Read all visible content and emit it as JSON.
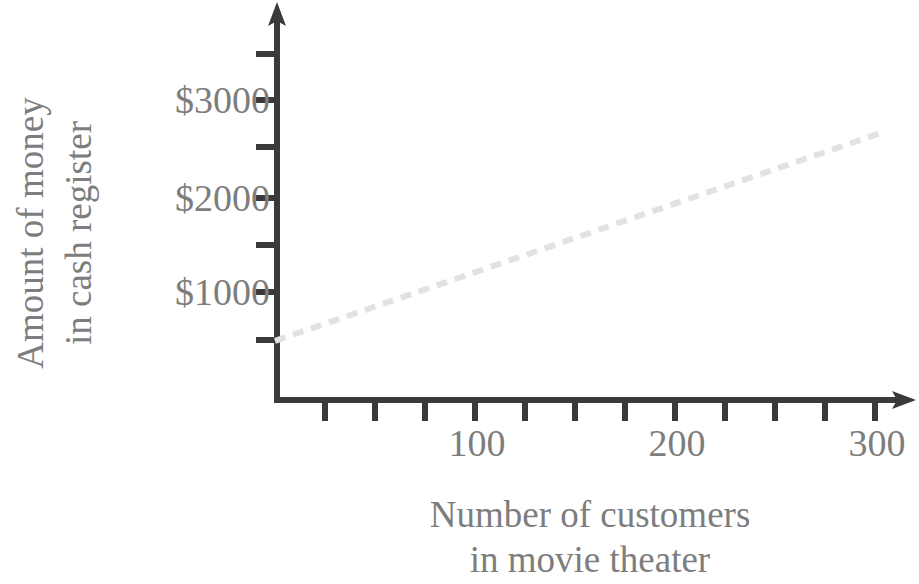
{
  "chart_data": {
    "type": "line",
    "title": "",
    "subtitle": "",
    "xlabel": "Number of customers in movie theater",
    "ylabel": "Amount of money in cash register",
    "xlabel_lines": [
      "Number of customers",
      "in movie theater"
    ],
    "ylabel_lines": [
      "Amount of money",
      "in cash register"
    ],
    "xlim": [
      0,
      310
    ],
    "ylim": [
      0,
      3500
    ],
    "x_tick_labels": [
      "100",
      "200",
      "300"
    ],
    "x_tick_values": [
      100,
      200,
      300
    ],
    "x_minor_tick_values": [
      50,
      100,
      150,
      200,
      250,
      300
    ],
    "x_all_tick_values": [
      50,
      100,
      150,
      200,
      250,
      300
    ],
    "y_tick_labels": [
      "$1000",
      "$2000",
      "$3000"
    ],
    "y_tick_values": [
      1000,
      2000,
      3000
    ],
    "y_all_tick_values": [
      500,
      1000,
      1500,
      2000,
      2500,
      3000,
      3500
    ],
    "grid": false,
    "legend": false,
    "legend_position": "none",
    "line_style": "dashed",
    "line_color": "#e2e2e2",
    "axis_color": "#3a3a3a",
    "text_color": "#7d7d7d",
    "background_color": "#ffffff",
    "series": [
      {
        "name": "Amount of money in cash register",
        "style": "dashed",
        "color": "#e2e2e2",
        "x": [
          0,
          50,
          100,
          150,
          200,
          250,
          304
        ],
        "values": [
          480,
          845,
          1210,
          1575,
          1940,
          2305,
          2700
        ],
        "intercept": 480,
        "slope_per_customer": 7.3
      }
    ],
    "annotations": []
  },
  "axes": {
    "y": {
      "ticks": [
        {
          "label": "$3000",
          "value": 3000
        },
        {
          "label": "$2000",
          "value": 2000
        },
        {
          "label": "$1000",
          "value": 1000
        }
      ],
      "title_lines": [
        "Amount of money",
        "in cash register"
      ]
    },
    "x": {
      "ticks": [
        {
          "label": "100",
          "value": 100
        },
        {
          "label": "200",
          "value": 200
        },
        {
          "label": "300",
          "value": 300
        }
      ],
      "title_lines": [
        "Number of customers",
        "in movie theater"
      ]
    }
  },
  "labels": {
    "y_3000": "$3000",
    "y_2000": "$2000",
    "y_1000": "$1000",
    "x_100": "100",
    "x_200": "200",
    "x_300": "300",
    "x_title_line1": "Number of customers",
    "x_title_line2": "in movie theater",
    "y_title_line1": "Amount of money",
    "y_title_line2": "in cash register"
  }
}
